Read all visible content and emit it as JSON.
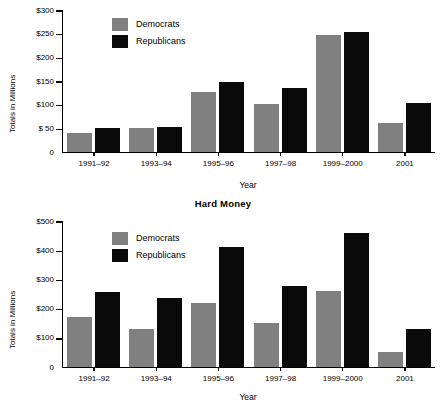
{
  "figure": {
    "y_axis_title": "Totals in Millions",
    "x_axis_title": "Year"
  },
  "legend": {
    "democrats_label": "Democrats",
    "republicans_label": "Republicans",
    "democrats_color": "#808080",
    "republicans_color": "#0a0a0a"
  },
  "charts": [
    {
      "id": "soft-money",
      "title": "Soft Money",
      "title_visible": false,
      "ytick_labels": [
        "$300",
        "$250",
        "$200",
        "$150",
        "$100",
        "$ 50",
        "0"
      ],
      "ytick_values": [
        300,
        250,
        200,
        150,
        100,
        50,
        0
      ]
    },
    {
      "id": "hard-money",
      "title": "Hard Money",
      "title_visible": true,
      "ytick_labels": [
        "$500",
        "$400",
        "$300",
        "$200",
        "$100",
        "0"
      ],
      "ytick_values": [
        500,
        400,
        300,
        200,
        100,
        0
      ]
    }
  ],
  "chart_data": [
    {
      "type": "bar",
      "title": "Soft Money",
      "xlabel": "Year",
      "ylabel": "Totals in Millions",
      "categories": [
        "1991–92",
        "1993–94",
        "1995–96",
        "1997–98",
        "1999–2000",
        "2001"
      ],
      "series": [
        {
          "name": "Democrats",
          "color": "#808080",
          "values": [
            40,
            51,
            126,
            101,
            247,
            62
          ]
        },
        {
          "name": "Republicans",
          "color": "#0a0a0a",
          "values": [
            51,
            52,
            147,
            136,
            253,
            103
          ]
        }
      ],
      "ylim": [
        0,
        300
      ],
      "yticks": [
        0,
        50,
        100,
        150,
        200,
        250,
        300
      ],
      "ytick_labels": [
        "0",
        "$ 50",
        "$100",
        "$150",
        "$200",
        "$250",
        "$300"
      ],
      "grid": false,
      "legend_position": "upper-left-inside",
      "units": "millions of US dollars"
    },
    {
      "type": "bar",
      "title": "Hard Money",
      "xlabel": "Year",
      "ylabel": "Totals in Millions",
      "categories": [
        "1991–92",
        "1993–94",
        "1995–96",
        "1997–98",
        "1999–2000",
        "2001"
      ],
      "series": [
        {
          "name": "Democrats",
          "color": "#808080",
          "values": [
            170,
            130,
            218,
            152,
            262,
            50
          ]
        },
        {
          "name": "Republicans",
          "color": "#0a0a0a",
          "values": [
            258,
            238,
            410,
            278,
            458,
            130
          ]
        }
      ],
      "ylim": [
        0,
        500
      ],
      "yticks": [
        0,
        100,
        200,
        300,
        400,
        500
      ],
      "ytick_labels": [
        "0",
        "$100",
        "$200",
        "$300",
        "$400",
        "$500"
      ],
      "grid": false,
      "legend_position": "upper-left-inside",
      "units": "millions of US dollars"
    }
  ]
}
